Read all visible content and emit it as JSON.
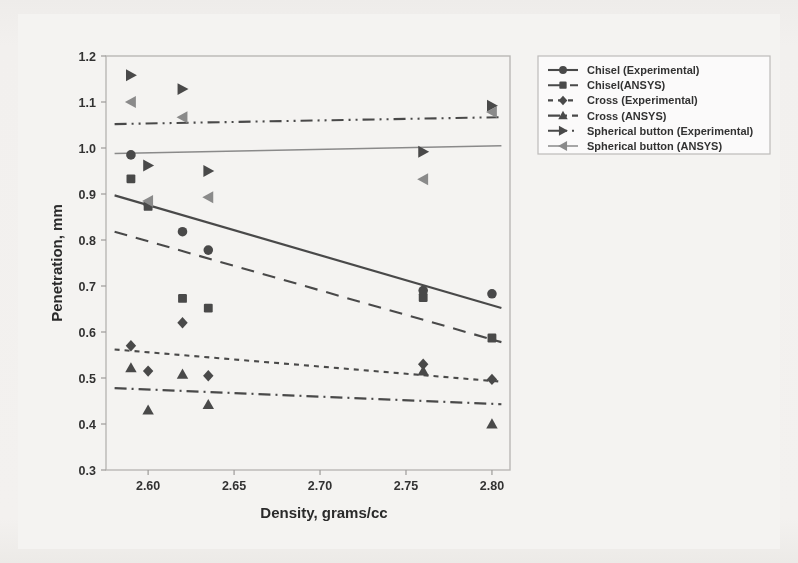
{
  "chart_data": {
    "type": "scatter",
    "title": "",
    "xlabel": "Density, grams/cc",
    "ylabel": "Penetration, mm",
    "xlim": [
      2.5755,
      2.8105
    ],
    "ylim": [
      0.3,
      1.2
    ],
    "xticks": [
      2.6,
      2.65,
      2.7,
      2.75,
      2.8
    ],
    "xticklabels": [
      "2.60",
      "2.65",
      "2.70",
      "2.75",
      "2.80"
    ],
    "yticks": [
      0.3,
      0.4,
      0.5,
      0.6,
      0.7,
      0.8,
      0.9,
      1.0,
      1.1,
      1.2
    ],
    "yticklabels": [
      "0.3",
      "0.4",
      "0.5",
      "0.6",
      "0.7",
      "0.8",
      "0.9",
      "1.0",
      "1.1",
      "1.2"
    ],
    "grid": false,
    "legend_position": "right-outside",
    "series": [
      {
        "name": "Chisel (Experimental)",
        "marker": "circle",
        "line_style": "solid",
        "color": "#4a4a4a",
        "points": [
          {
            "x": 2.59,
            "y": 0.985
          },
          {
            "x": 2.6,
            "y": 0.878
          },
          {
            "x": 2.62,
            "y": 0.818
          },
          {
            "x": 2.635,
            "y": 0.778
          },
          {
            "x": 2.76,
            "y": 0.69
          },
          {
            "x": 2.8,
            "y": 0.683
          }
        ],
        "fit_line": {
          "x": [
            2.5805,
            2.8055
          ],
          "y": [
            0.897,
            0.652
          ]
        }
      },
      {
        "name": "Chisel(ANSYS)",
        "marker": "square",
        "line_style": "dashed",
        "color": "#4a4a4a",
        "points": [
          {
            "x": 2.59,
            "y": 0.933
          },
          {
            "x": 2.6,
            "y": 0.873
          },
          {
            "x": 2.62,
            "y": 0.673
          },
          {
            "x": 2.635,
            "y": 0.652
          },
          {
            "x": 2.76,
            "y": 0.675
          },
          {
            "x": 2.8,
            "y": 0.587
          }
        ],
        "fit_line": {
          "x": [
            2.5805,
            2.8055
          ],
          "y": [
            0.818,
            0.578
          ]
        }
      },
      {
        "name": "Cross (Experimental)",
        "marker": "diamond",
        "line_style": "dotted",
        "color": "#4a4a4a",
        "points": [
          {
            "x": 2.59,
            "y": 0.57
          },
          {
            "x": 2.6,
            "y": 0.515
          },
          {
            "x": 2.62,
            "y": 0.62
          },
          {
            "x": 2.635,
            "y": 0.505
          },
          {
            "x": 2.76,
            "y": 0.53
          },
          {
            "x": 2.8,
            "y": 0.497
          }
        ],
        "fit_line": {
          "x": [
            2.5805,
            2.8055
          ],
          "y": [
            0.562,
            0.492
          ]
        }
      },
      {
        "name": "Cross (ANSYS)",
        "marker": "triangle-up",
        "line_style": "dashdot",
        "color": "#4a4a4a",
        "points": [
          {
            "x": 2.59,
            "y": 0.522
          },
          {
            "x": 2.6,
            "y": 0.43
          },
          {
            "x": 2.62,
            "y": 0.508
          },
          {
            "x": 2.635,
            "y": 0.442
          },
          {
            "x": 2.76,
            "y": 0.515
          },
          {
            "x": 2.8,
            "y": 0.4
          }
        ],
        "fit_line": {
          "x": [
            2.5805,
            2.8055
          ],
          "y": [
            0.478,
            0.443
          ]
        }
      },
      {
        "name": "Spherical button (Experimental)",
        "marker": "triangle-right",
        "line_style": "dashdotdot",
        "color": "#4a4a4a",
        "points": [
          {
            "x": 2.59,
            "y": 1.158
          },
          {
            "x": 2.6,
            "y": 0.962
          },
          {
            "x": 2.62,
            "y": 1.128
          },
          {
            "x": 2.635,
            "y": 0.95
          },
          {
            "x": 2.76,
            "y": 0.992
          },
          {
            "x": 2.8,
            "y": 1.092
          }
        ],
        "fit_line": {
          "x": [
            2.5805,
            2.8055
          ],
          "y": [
            1.052,
            1.067
          ]
        }
      },
      {
        "name": "Spherical button (ANSYS)",
        "marker": "triangle-left",
        "line_style": "solid-thin",
        "color": "#8a8a8a",
        "points": [
          {
            "x": 2.59,
            "y": 1.1
          },
          {
            "x": 2.6,
            "y": 0.885
          },
          {
            "x": 2.62,
            "y": 1.067
          },
          {
            "x": 2.635,
            "y": 0.893
          },
          {
            "x": 2.76,
            "y": 0.932
          },
          {
            "x": 2.8,
            "y": 1.078
          }
        ],
        "fit_line": {
          "x": [
            2.5805,
            2.8055
          ],
          "y": [
            0.988,
            1.005
          ]
        }
      }
    ]
  },
  "legend": {
    "items": [
      {
        "label": "Chisel (Experimental)"
      },
      {
        "label": "Chisel(ANSYS)"
      },
      {
        "label": "Cross (Experimental)"
      },
      {
        "label": "Cross (ANSYS)"
      },
      {
        "label": "Spherical button (Experimental)"
      },
      {
        "label": "Spherical button (ANSYS)"
      }
    ]
  },
  "colors": {
    "marker_dark": "#4a4a4a",
    "marker_light": "#8a8a8a",
    "frame": "#b9b7b5",
    "background": "#f4f3f1",
    "page_background": "#eceae7"
  }
}
